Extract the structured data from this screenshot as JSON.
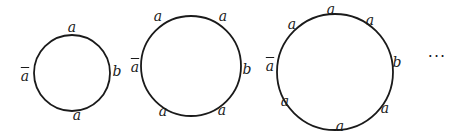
{
  "diagram": {
    "stroke_color": "#1a1a1a",
    "background": "#ffffff",
    "circles": [
      {
        "id": "circle-1",
        "cx": 72,
        "cy": 73,
        "r": 38,
        "labels": [
          {
            "text": "a",
            "bar": false,
            "x": 72,
            "y": 27
          },
          {
            "text": "a",
            "bar": true,
            "x": 25,
            "y": 76
          },
          {
            "text": "b",
            "bar": false,
            "x": 117,
            "y": 71
          },
          {
            "text": "a",
            "bar": false,
            "x": 77,
            "y": 115
          }
        ]
      },
      {
        "id": "circle-2",
        "cx": 191,
        "cy": 66,
        "r": 50,
        "labels": [
          {
            "text": "a",
            "bar": false,
            "x": 158,
            "y": 16
          },
          {
            "text": "a",
            "bar": false,
            "x": 223,
            "y": 16
          },
          {
            "text": "a",
            "bar": true,
            "x": 135,
            "y": 67
          },
          {
            "text": "b",
            "bar": false,
            "x": 247,
            "y": 69
          },
          {
            "text": "a",
            "bar": false,
            "x": 163,
            "y": 111
          },
          {
            "text": "a",
            "bar": false,
            "x": 222,
            "y": 110
          }
        ]
      },
      {
        "id": "circle-3",
        "cx": 335,
        "cy": 72,
        "r": 58,
        "labels": [
          {
            "text": "a",
            "bar": false,
            "x": 331,
            "y": 9
          },
          {
            "text": "a",
            "bar": false,
            "x": 292,
            "y": 24
          },
          {
            "text": "a",
            "bar": false,
            "x": 370,
            "y": 20
          },
          {
            "text": "a",
            "bar": true,
            "x": 270,
            "y": 66
          },
          {
            "text": "b",
            "bar": false,
            "x": 397,
            "y": 62
          },
          {
            "text": "a",
            "bar": false,
            "x": 285,
            "y": 101
          },
          {
            "text": "a",
            "bar": false,
            "x": 385,
            "y": 108
          },
          {
            "text": "a",
            "bar": false,
            "x": 340,
            "y": 126
          }
        ]
      }
    ],
    "ellipsis": {
      "text": "···",
      "x": 437,
      "y": 56
    }
  }
}
